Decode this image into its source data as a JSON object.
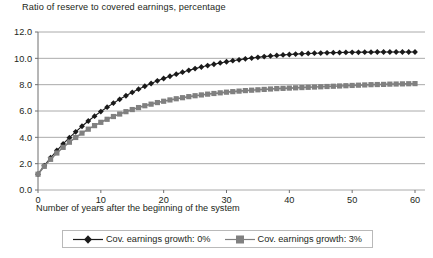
{
  "chart_data": {
    "type": "line",
    "title": "Ratio of reserve to covered earnings, percentage",
    "xlabel": "Number of years after the beginning of the system",
    "ylabel": "",
    "xlim": [
      0,
      62
    ],
    "ylim": [
      0,
      12
    ],
    "ytick_labels": [
      "12.0",
      "10.0",
      "8.0",
      "6.0",
      "4.0",
      "2.0",
      "0.0"
    ],
    "ytick_values": [
      12,
      10,
      8,
      6,
      4,
      2,
      0
    ],
    "xtick_labels": [
      "0",
      "10",
      "20",
      "30",
      "40",
      "50",
      "60"
    ],
    "xtick_values": [
      0,
      10,
      20,
      30,
      40,
      50,
      60
    ],
    "grid": "horizontal",
    "legend_position": "bottom",
    "series": [
      {
        "name": "Cov. earnings growth: 0%",
        "color": "#1a1a1a",
        "marker": "diamond",
        "x": [
          0,
          1,
          2,
          3,
          4,
          5,
          6,
          7,
          8,
          9,
          10,
          11,
          12,
          13,
          14,
          15,
          16,
          17,
          18,
          19,
          20,
          21,
          22,
          23,
          24,
          25,
          26,
          27,
          28,
          29,
          30,
          31,
          32,
          33,
          34,
          35,
          36,
          37,
          38,
          39,
          40,
          41,
          42,
          43,
          44,
          45,
          46,
          47,
          48,
          49,
          50,
          51,
          52,
          53,
          54,
          55,
          56,
          57,
          58,
          59,
          60
        ],
        "values": [
          1.2,
          1.85,
          2.45,
          3.0,
          3.5,
          3.97,
          4.42,
          4.84,
          5.24,
          5.61,
          5.96,
          6.29,
          6.6,
          6.89,
          7.16,
          7.42,
          7.66,
          7.88,
          8.09,
          8.29,
          8.47,
          8.64,
          8.8,
          8.95,
          9.09,
          9.22,
          9.34,
          9.45,
          9.55,
          9.65,
          9.74,
          9.82,
          9.89,
          9.96,
          10.02,
          10.08,
          10.13,
          10.18,
          10.22,
          10.26,
          10.29,
          10.32,
          10.35,
          10.37,
          10.39,
          10.4,
          10.42,
          10.43,
          10.44,
          10.45,
          10.46,
          10.46,
          10.47,
          10.47,
          10.48,
          10.48,
          10.48,
          10.48,
          10.48,
          10.48,
          10.48
        ]
      },
      {
        "name": "Cov. earnings growth: 3%",
        "color": "#808080",
        "marker": "square",
        "x": [
          0,
          1,
          2,
          3,
          4,
          5,
          6,
          7,
          8,
          9,
          10,
          11,
          12,
          13,
          14,
          15,
          16,
          17,
          18,
          19,
          20,
          21,
          22,
          23,
          24,
          25,
          26,
          27,
          28,
          29,
          30,
          31,
          32,
          33,
          34,
          35,
          36,
          37,
          38,
          39,
          40,
          41,
          42,
          43,
          44,
          45,
          46,
          47,
          48,
          49,
          50,
          51,
          52,
          53,
          54,
          55,
          56,
          57,
          58,
          59,
          60
        ],
        "values": [
          1.2,
          1.8,
          2.33,
          2.81,
          3.24,
          3.63,
          3.99,
          4.32,
          4.62,
          4.89,
          5.14,
          5.37,
          5.58,
          5.77,
          5.95,
          6.11,
          6.26,
          6.4,
          6.52,
          6.64,
          6.74,
          6.84,
          6.93,
          7.01,
          7.09,
          7.16,
          7.22,
          7.28,
          7.33,
          7.38,
          7.43,
          7.47,
          7.51,
          7.55,
          7.58,
          7.61,
          7.64,
          7.67,
          7.7,
          7.72,
          7.74,
          7.76,
          7.78,
          7.8,
          7.82,
          7.84,
          7.86,
          7.88,
          7.9,
          7.92,
          7.94,
          7.96,
          7.98,
          8.0,
          8.01,
          8.02,
          8.04,
          8.05,
          8.06,
          8.07,
          8.08
        ]
      }
    ]
  },
  "legend": {
    "items": [
      {
        "label": "Cov. earnings growth: 0%"
      },
      {
        "label": "Cov. earnings growth: 3%"
      }
    ]
  }
}
